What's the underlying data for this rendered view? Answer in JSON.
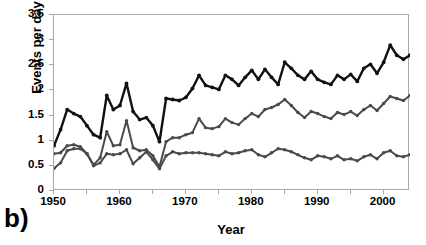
{
  "panel": {
    "letter": "b)"
  },
  "axes": {
    "y_title": "Events per day",
    "x_title": "Year",
    "y_ticks": [
      "0",
      "0.5",
      "1",
      "1.5",
      "2",
      "2.5",
      "3",
      "3.5"
    ],
    "x_ticks": [
      "1950",
      "1960",
      "1970",
      "1980",
      "1990",
      "2000"
    ],
    "frame_color": "#a8a8a8"
  },
  "colors": {
    "series_top": "#111111",
    "series_middle": "#4a4a4a",
    "series_bottom": "#4a4a4a"
  },
  "chart_data": {
    "type": "line",
    "title": "",
    "xlabel": "Year",
    "ylabel": "Events per day",
    "xlim": [
      1950,
      2004
    ],
    "ylim": [
      0,
      3.5
    ],
    "ytick_values": [
      0,
      0.5,
      1,
      1.5,
      2,
      2.5,
      3,
      3.5
    ],
    "xtick_values": [
      1950,
      1960,
      1970,
      1980,
      1990,
      2000
    ],
    "xtick_minor_step": 5,
    "grid": false,
    "legend": "none",
    "markers": "filled-circle",
    "annotations": [
      "b)"
    ],
    "x": [
      1950,
      1951,
      1952,
      1953,
      1954,
      1955,
      1956,
      1957,
      1958,
      1959,
      1960,
      1961,
      1962,
      1963,
      1964,
      1965,
      1966,
      1967,
      1968,
      1969,
      1970,
      1971,
      1972,
      1973,
      1974,
      1975,
      1976,
      1977,
      1978,
      1979,
      1980,
      1981,
      1982,
      1983,
      1984,
      1985,
      1986,
      1987,
      1988,
      1989,
      1990,
      1991,
      1992,
      1993,
      1994,
      1995,
      1996,
      1997,
      1998,
      1999,
      2000,
      2001,
      2002,
      2003,
      2004
    ],
    "series": [
      {
        "name": "upper",
        "color": "#111111",
        "values": [
          0.9,
          1.22,
          1.62,
          1.54,
          1.48,
          1.3,
          1.12,
          1.06,
          1.9,
          1.62,
          1.7,
          2.14,
          1.58,
          1.42,
          1.46,
          1.3,
          0.98,
          1.84,
          1.82,
          1.8,
          1.86,
          2.04,
          2.3,
          2.1,
          2.06,
          2.02,
          2.3,
          2.22,
          2.1,
          2.26,
          2.4,
          2.22,
          2.42,
          2.26,
          2.12,
          2.56,
          2.44,
          2.3,
          2.22,
          2.38,
          2.22,
          2.16,
          2.12,
          2.3,
          2.22,
          2.32,
          2.18,
          2.44,
          2.52,
          2.34,
          2.56,
          2.9,
          2.7,
          2.62,
          2.7
        ]
      },
      {
        "name": "middle",
        "color": "#4a4a4a",
        "values": [
          0.74,
          0.76,
          0.9,
          0.92,
          0.88,
          0.74,
          0.52,
          0.66,
          1.18,
          0.9,
          0.92,
          1.4,
          0.86,
          0.8,
          0.82,
          0.7,
          0.48,
          0.98,
          1.06,
          1.06,
          1.12,
          1.16,
          1.44,
          1.26,
          1.24,
          1.28,
          1.44,
          1.36,
          1.32,
          1.44,
          1.54,
          1.48,
          1.62,
          1.66,
          1.72,
          1.82,
          1.7,
          1.56,
          1.46,
          1.58,
          1.54,
          1.48,
          1.44,
          1.56,
          1.52,
          1.58,
          1.5,
          1.62,
          1.7,
          1.6,
          1.74,
          1.88,
          1.84,
          1.8,
          1.9
        ]
      },
      {
        "name": "lower",
        "color": "#4a4a4a",
        "values": [
          0.45,
          0.56,
          0.8,
          0.84,
          0.84,
          0.74,
          0.5,
          0.56,
          0.74,
          0.72,
          0.74,
          0.82,
          0.54,
          0.66,
          0.78,
          0.62,
          0.44,
          0.7,
          0.78,
          0.74,
          0.76,
          0.76,
          0.76,
          0.74,
          0.72,
          0.7,
          0.78,
          0.74,
          0.76,
          0.8,
          0.82,
          0.72,
          0.68,
          0.76,
          0.84,
          0.82,
          0.78,
          0.72,
          0.66,
          0.62,
          0.7,
          0.68,
          0.64,
          0.7,
          0.62,
          0.64,
          0.6,
          0.68,
          0.72,
          0.64,
          0.76,
          0.8,
          0.7,
          0.68,
          0.72
        ]
      }
    ]
  }
}
